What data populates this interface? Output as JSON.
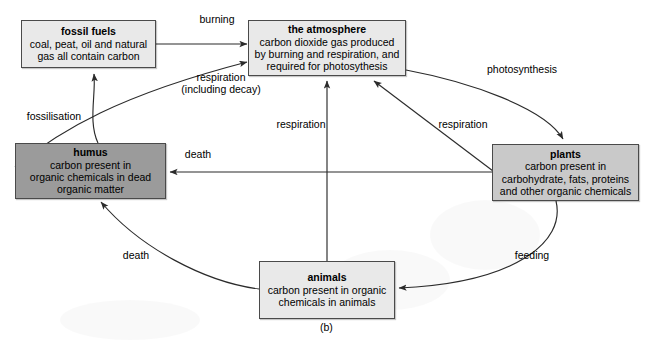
{
  "figure": {
    "caption": "(b)",
    "kind": "carbon-cycle-diagram"
  },
  "colors": {
    "light_box": "#e9e9e9",
    "mid_box": "#c9c9c9",
    "dark_box": "#9b9b9b",
    "border": "#4a4a4a",
    "line": "#2b2b2b",
    "text": "#000000",
    "background": "#ffffff"
  },
  "nodes": [
    {
      "id": "fossil-fuels",
      "title": "fossil fuels",
      "body": "coal, peat, oil and natural\ngas all contain carbon",
      "shade": "light"
    },
    {
      "id": "the-atmosphere",
      "title": "the atmosphere",
      "body": "carbon dioxide gas produced\nby burning and respiration, and\nrequired for photosythesis",
      "shade": "light"
    },
    {
      "id": "humus",
      "title": "humus",
      "body": "carbon present in\norganic chemicals in dead\norganic matter",
      "shade": "dark"
    },
    {
      "id": "plants",
      "title": "plants",
      "body": "carbon present in\ncarbohydrate, fats, proteins\nand other organic chemicals",
      "shade": "dark"
    },
    {
      "id": "animals",
      "title": "animals",
      "body": "carbon present in organic\nchemicals in animals",
      "shade": "light"
    }
  ],
  "edges": [
    {
      "id": "burning",
      "label": "burning",
      "from": "fossil-fuels",
      "to": "the-atmosphere"
    },
    {
      "id": "respiration-decay",
      "label": "respiration\n(including decay)",
      "from": "humus",
      "to": "the-atmosphere"
    },
    {
      "id": "fossilisation",
      "label": "fossilisation",
      "from": "humus",
      "to": "fossil-fuels"
    },
    {
      "id": "photosynthesis",
      "label": "photosynthesis",
      "from": "the-atmosphere",
      "to": "plants"
    },
    {
      "id": "respiration-plants",
      "label": "respiration",
      "from": "plants",
      "to": "the-atmosphere"
    },
    {
      "id": "respiration-animals",
      "label": "respiration",
      "from": "animals",
      "to": "the-atmosphere"
    },
    {
      "id": "death-plants",
      "label": "death",
      "from": "plants",
      "to": "humus"
    },
    {
      "id": "death-animals",
      "label": "death",
      "from": "animals",
      "to": "humus"
    },
    {
      "id": "feeding",
      "label": "feeding",
      "from": "plants",
      "to": "animals"
    }
  ]
}
